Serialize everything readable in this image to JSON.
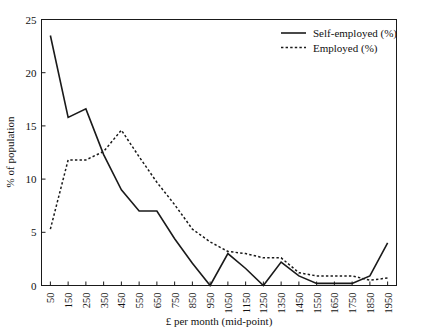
{
  "chart_data": {
    "type": "line",
    "title": "",
    "xlabel": "£ per month (mid-point)",
    "ylabel": "% of population",
    "categories": [
      50,
      150,
      250,
      350,
      450,
      550,
      650,
      750,
      850,
      950,
      1050,
      1150,
      1250,
      1350,
      1450,
      1550,
      1650,
      1750,
      1850,
      1950
    ],
    "xtick_labels": [
      "50",
      "150",
      "250",
      "350",
      "450",
      "550",
      "650",
      "750",
      "850",
      "950",
      "1050",
      "1150",
      "1250",
      "1350",
      "1450",
      "1550",
      "1650",
      "1750",
      "1850",
      "1950"
    ],
    "ytick_labels": [
      "0",
      "5",
      "10",
      "15",
      "20",
      "25"
    ],
    "yticks": [
      0,
      5,
      10,
      15,
      20,
      25
    ],
    "ylim": [
      0,
      25
    ],
    "grid": false,
    "legend_position": "top-right",
    "series": [
      {
        "name": "Self-employed (%)",
        "style": "solid",
        "color": "#1a1a1a",
        "values": [
          23.5,
          15.8,
          16.6,
          12.3,
          9.0,
          7.0,
          7.0,
          4.4,
          2.1,
          0.0,
          3.0,
          1.6,
          0.0,
          2.2,
          0.9,
          0.2,
          0.2,
          0.2,
          0.9,
          4.0
        ]
      },
      {
        "name": "Employed (%)",
        "style": "dashed",
        "color": "#1a1a1a",
        "values": [
          5.3,
          11.8,
          11.8,
          12.6,
          14.6,
          12.1,
          9.7,
          7.6,
          5.3,
          4.1,
          3.2,
          3.0,
          2.6,
          2.6,
          1.2,
          0.9,
          0.9,
          0.9,
          0.5,
          0.7
        ]
      }
    ]
  },
  "legend": {
    "items": [
      {
        "label": "Self-employed (%)",
        "style": "solid"
      },
      {
        "label": "Employed (%)",
        "style": "dashed"
      }
    ]
  }
}
